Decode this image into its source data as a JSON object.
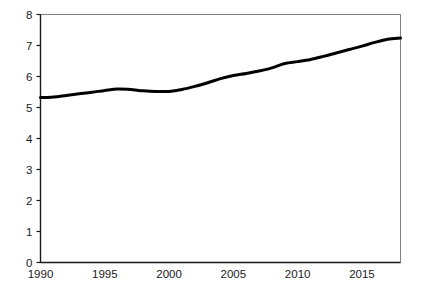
{
  "chart_data": {
    "type": "line",
    "title": "",
    "subtitle": "",
    "xlabel": "",
    "ylabel": "",
    "xlim": [
      1990,
      2018
    ],
    "ylim": [
      0,
      8
    ],
    "grid": false,
    "legend": null,
    "annotations": [],
    "x_tick_labels": [
      "1990",
      "1995",
      "2000",
      "2005",
      "2010",
      "2015"
    ],
    "x_tick_values": [
      1990,
      1995,
      2000,
      2005,
      2010,
      2015
    ],
    "y_tick_labels": [
      "0",
      "1",
      "2",
      "3",
      "4",
      "5",
      "6",
      "7",
      "8"
    ],
    "y_tick_values": [
      0,
      1,
      2,
      3,
      4,
      5,
      6,
      7,
      8
    ],
    "series": [
      {
        "name": "series-1",
        "color": "#000000",
        "line_width": 3,
        "x": [
          1990,
          1991,
          1992,
          1993,
          1994,
          1995,
          1996,
          1997,
          1998,
          1999,
          2000,
          2001,
          2002,
          2003,
          2004,
          2005,
          2006,
          2007,
          2008,
          2009,
          2010,
          2011,
          2012,
          2013,
          2014,
          2015,
          2016,
          2017,
          2018
        ],
        "values": [
          5.32,
          5.34,
          5.39,
          5.44,
          5.49,
          5.55,
          5.6,
          5.58,
          5.54,
          5.52,
          5.52,
          5.58,
          5.68,
          5.8,
          5.93,
          6.03,
          6.1,
          6.18,
          6.28,
          6.42,
          6.48,
          6.55,
          6.65,
          6.76,
          6.87,
          6.98,
          7.1,
          7.2,
          7.24
        ]
      }
    ]
  },
  "axes": {
    "frame_color": "#808080",
    "axis_color": "#1a1a1a",
    "background": "#ffffff"
  }
}
